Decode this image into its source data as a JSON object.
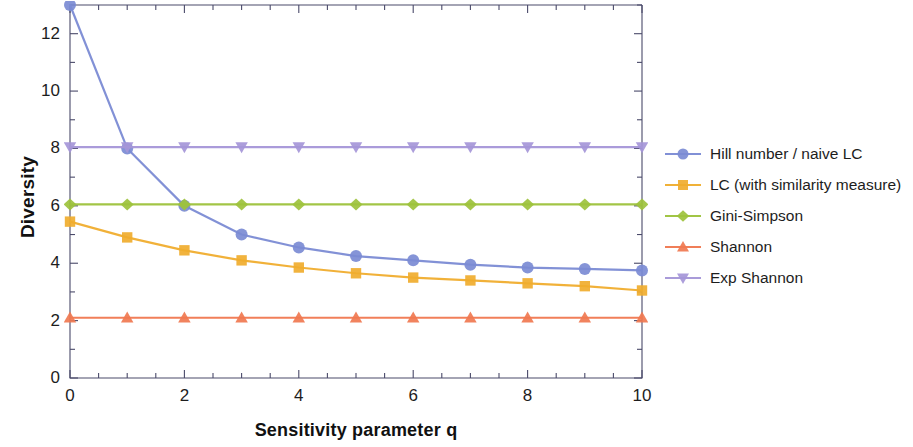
{
  "chart_data": {
    "type": "line",
    "title": "",
    "xlabel": "Sensitivity parameter q",
    "ylabel": "Diversity",
    "xlim": [
      0,
      10
    ],
    "ylim": [
      0,
      13
    ],
    "grid": false,
    "legend_position": "right",
    "x": [
      0,
      1,
      2,
      3,
      4,
      5,
      6,
      7,
      8,
      9,
      10
    ],
    "xticks": [
      "0",
      "2",
      "4",
      "6",
      "8",
      "10"
    ],
    "xtick_values": [
      0,
      2,
      4,
      6,
      8,
      10
    ],
    "yticks": [
      "0",
      "2",
      "4",
      "6",
      "8",
      "10",
      "12"
    ],
    "ytick_values": [
      0,
      2,
      4,
      6,
      8,
      10,
      12
    ],
    "yminor_values": [
      1,
      3,
      5,
      7,
      9,
      11,
      13
    ],
    "xminor_values": [
      0.5,
      1,
      1.5,
      2.5,
      3,
      3.5,
      4.5,
      5,
      5.5,
      6.5,
      7,
      7.5,
      8.5,
      9,
      9.5
    ],
    "series": [
      {
        "name": "Hill number / naive LC",
        "color": "#7b8bd4",
        "marker": "circle",
        "values": [
          13.0,
          8.0,
          6.0,
          5.0,
          4.55,
          4.25,
          4.1,
          3.95,
          3.85,
          3.8,
          3.75
        ]
      },
      {
        "name": "LC (with similarity measure)",
        "color": "#f0ad2e",
        "marker": "square",
        "values": [
          5.45,
          4.9,
          4.45,
          4.1,
          3.85,
          3.65,
          3.5,
          3.4,
          3.3,
          3.2,
          3.05
        ]
      },
      {
        "name": "Gini-Simpson",
        "color": "#9dc23c",
        "marker": "diamond",
        "values": [
          6.05,
          6.05,
          6.05,
          6.05,
          6.05,
          6.05,
          6.05,
          6.05,
          6.05,
          6.05,
          6.05
        ]
      },
      {
        "name": "Shannon",
        "color": "#f07850",
        "marker": "triangle-up",
        "values": [
          2.1,
          2.1,
          2.1,
          2.1,
          2.1,
          2.1,
          2.1,
          2.1,
          2.1,
          2.1,
          2.1
        ]
      },
      {
        "name": "Exp Shannon",
        "color": "#a596d8",
        "marker": "triangle-down",
        "values": [
          8.05,
          8.05,
          8.05,
          8.05,
          8.05,
          8.05,
          8.05,
          8.05,
          8.05,
          8.05,
          8.05
        ]
      }
    ]
  },
  "axes": {
    "frame_color": "#4a4a6a"
  }
}
